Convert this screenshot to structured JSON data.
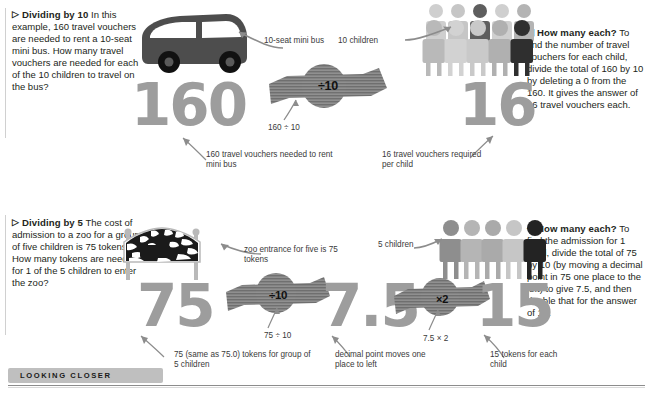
{
  "sections": [
    {
      "id": "dividing-by-10",
      "heading": "Dividing by 10",
      "marker": "▷",
      "intro": "In this example, 160 travel vouchers are needed to rent a 10-seat mini bus. How many travel vouchers are needed for each of the 10 children to travel on the bus?",
      "right_heading": "How many each?",
      "right_marker": "◁",
      "right_text": "To find the number of travel vouchers for each child, divide the total of 160 by 10 by deleting a 0 from the 160. It gives the answer of 16 travel vouchers each.",
      "object_label": "10-seat mini bus",
      "people_label": "10 children",
      "start_number": "160",
      "operator": "÷10",
      "operator_caption": "160 ÷ 10",
      "result_number": "16",
      "start_caption": "160 travel vouchers needed to rent mini bus",
      "result_caption": "16 travel vouchers required per child",
      "people_count": 10
    },
    {
      "id": "dividing-by-5",
      "heading": "Dividing by 5",
      "marker": "▷",
      "intro": "The cost of admission to a zoo for a group of five children is 75 tokens. How many tokens are needed for 1 of the 5 children to enter the zoo?",
      "right_heading": "How many each?",
      "right_marker": "◁",
      "right_text": "To find the admission for 1 child, divide the total of 75 by 10 (by moving a decimal point in 75 one place to the left) to give 7.5, and then double that for the answer of 15.",
      "object_label": "zoo entrance for five is 75 tokens",
      "people_label": "5 children",
      "start_number": "75",
      "operator": "÷10",
      "operator_caption": "75 ÷ 10",
      "middle_number": "7.5",
      "operator2": "×2",
      "operator2_caption": "7.5 × 2",
      "result_number": "15",
      "start_caption": "75 (same as 75.0) tokens for group of 5 children",
      "middle_caption": "decimal point moves one place to left",
      "result_caption": "15 tokens for each child",
      "people_count": 5
    }
  ],
  "footer": {
    "label": "LOOKING CLOSER"
  },
  "colors": {
    "numeral_gray": "#9d9d9d",
    "banner_gray": "#8f8f8f",
    "bus_dark": "#4d4d4d",
    "accent_black": "#1a1a1a",
    "caption_gray": "#3a3a3a",
    "footer_tab": "#bfbfbf"
  },
  "icons": {
    "bus": "mini-bus-icon",
    "zoo_sign": "zebra-zoo-sign-icon",
    "person": "person-silhouette-icon",
    "arrow": "curved-arrow-icon",
    "banner": "striped-arrow-banner-icon"
  }
}
